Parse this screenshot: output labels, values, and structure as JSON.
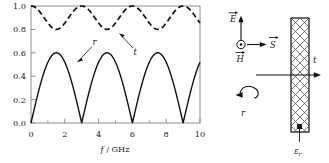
{
  "figure": {
    "kind": "physics-figure",
    "panels": [
      "plot",
      "schematic"
    ]
  },
  "chart_data": {
    "type": "line",
    "title": "",
    "xlabel": "f / GHz",
    "ylabel": "",
    "xlim": [
      0,
      10
    ],
    "ylim": [
      0.0,
      1.0
    ],
    "grid": false,
    "legend_position": "inline-annotations",
    "x_ticks": [
      0,
      2,
      4,
      6,
      8,
      10
    ],
    "x_tick_labels": [
      "0",
      "2",
      "4",
      "6",
      "8",
      "10"
    ],
    "x_minor_ticks": [
      1,
      3,
      5,
      7,
      9
    ],
    "y_ticks": [
      0.0,
      0.2,
      0.4,
      0.6,
      0.8,
      1.0
    ],
    "y_tick_labels": [
      "0.0",
      "0.2",
      "0.4",
      "0.6",
      "0.8",
      "1.0"
    ],
    "series": [
      {
        "name": "t",
        "label": "t",
        "style": "dashed",
        "color": "#111111",
        "description": "transmission magnitude, oscillates between 0.80 and 1.00 with period 3 GHz, maxima at f = 0, 3, 6, 9 GHz",
        "min": 0.8,
        "max": 1.0,
        "period_ghz": 3,
        "x": [
          0,
          0.25,
          0.5,
          0.75,
          1,
          1.25,
          1.5,
          1.75,
          2,
          2.25,
          2.5,
          2.75,
          3,
          3.25,
          3.5,
          3.75,
          4,
          4.25,
          4.5,
          4.75,
          5,
          5.25,
          5.5,
          5.75,
          6,
          6.25,
          6.5,
          6.75,
          7,
          7.25,
          7.5,
          7.75,
          8,
          8.25,
          8.5,
          8.75,
          9,
          9.25,
          9.5,
          9.75,
          10
        ],
        "values": [
          1.0,
          0.985,
          0.944,
          0.885,
          0.838,
          0.806,
          0.8,
          0.806,
          0.838,
          0.885,
          0.944,
          0.985,
          1.0,
          0.985,
          0.944,
          0.885,
          0.838,
          0.806,
          0.8,
          0.806,
          0.838,
          0.885,
          0.944,
          0.985,
          1.0,
          0.985,
          0.944,
          0.885,
          0.838,
          0.806,
          0.8,
          0.806,
          0.838,
          0.885,
          0.944,
          0.985,
          1.0,
          0.985,
          0.944,
          0.885,
          0.838
        ]
      },
      {
        "name": "r",
        "label": "r",
        "style": "solid",
        "color": "#111111",
        "description": "reflection magnitude, oscillates between 0.00 and 0.60 with period 3 GHz, zeros at f = 0, 3, 6, 9 GHz",
        "min": 0.0,
        "max": 0.6,
        "period_ghz": 3,
        "x": [
          0,
          0.25,
          0.5,
          0.75,
          1,
          1.25,
          1.5,
          1.75,
          2,
          2.25,
          2.5,
          2.75,
          3,
          3.25,
          3.5,
          3.75,
          4,
          4.25,
          4.5,
          4.75,
          5,
          5.25,
          5.5,
          5.75,
          6,
          6.25,
          6.5,
          6.75,
          7,
          7.25,
          7.5,
          7.75,
          8,
          8.25,
          8.5,
          8.75,
          9,
          9.25,
          9.5,
          9.75,
          10
        ],
        "values": [
          0.0,
          0.171,
          0.329,
          0.465,
          0.545,
          0.592,
          0.6,
          0.592,
          0.545,
          0.465,
          0.329,
          0.171,
          0.0,
          0.171,
          0.329,
          0.465,
          0.545,
          0.592,
          0.6,
          0.592,
          0.545,
          0.465,
          0.329,
          0.171,
          0.0,
          0.171,
          0.329,
          0.465,
          0.545,
          0.592,
          0.6,
          0.592,
          0.545,
          0.465,
          0.329,
          0.171,
          0.0,
          0.171,
          0.329,
          0.465,
          0.545
        ]
      }
    ],
    "annotations": [
      {
        "name": "t-annotation",
        "text": "t",
        "points_to_series": "t"
      },
      {
        "name": "r-annotation",
        "text": "r",
        "points_to_series": "r"
      }
    ]
  },
  "schematic": {
    "name": "dielectric-slab-schematic",
    "vectors": [
      {
        "name": "E-vector",
        "label": "E",
        "direction": "up"
      },
      {
        "name": "S-vector",
        "label": "S",
        "direction": "right"
      },
      {
        "name": "H-vector",
        "label": "H",
        "direction": "out-of-page"
      }
    ],
    "slab": {
      "name": "dielectric-slab",
      "fill": "cross-hatch",
      "permittivity_label": "ε",
      "permittivity_subscript": "r"
    },
    "rays": [
      {
        "name": "transmitted-ray",
        "label": "t",
        "direction": "right"
      },
      {
        "name": "reflected-ray",
        "label": "r",
        "direction": "left-curved"
      }
    ]
  },
  "colors": {
    "ink": "#1a1a1a",
    "curve": "#111111",
    "frame": "#8d8d8d",
    "background": "#ffffff"
  }
}
